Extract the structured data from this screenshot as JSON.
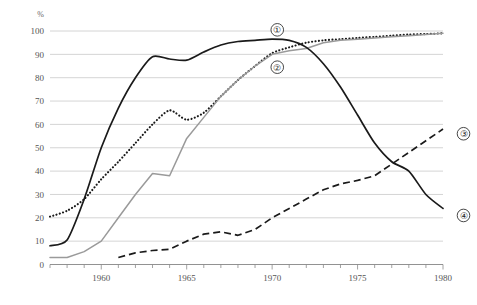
{
  "chart_data": {
    "type": "line",
    "title": "",
    "xlabel": "",
    "ylabel": "%",
    "yunit": "%",
    "xlim": [
      1957,
      1980
    ],
    "ylim": [
      0,
      100
    ],
    "grid": true,
    "legend_position": "inline-right",
    "yticks": [
      "0",
      "10",
      "20",
      "30",
      "40",
      "50",
      "60",
      "70",
      "80",
      "90",
      "100"
    ],
    "xticks": [
      "1960",
      "1965",
      "1970",
      "1975",
      "1980"
    ],
    "xtick_values": [
      1960,
      1965,
      1970,
      1975,
      1980
    ],
    "x_minor_ticks_every": 1,
    "series": [
      {
        "name": "1",
        "label": "①",
        "style": "dotted",
        "color": "#1a1a1a",
        "x": [
          1957,
          1958,
          1959,
          1960,
          1961,
          1962,
          1963,
          1964,
          1965,
          1966,
          1967,
          1968,
          1969,
          1970,
          1971,
          1972,
          1973,
          1974,
          1975,
          1976,
          1977,
          1978,
          1979,
          1980
        ],
        "values": [
          20.5,
          23,
          28,
          36.5,
          44,
          52,
          60,
          66,
          62,
          65,
          72,
          79,
          85,
          90.5,
          93,
          95,
          96,
          96.5,
          97,
          97.5,
          98,
          98.5,
          98.7,
          99
        ]
      },
      {
        "name": "2",
        "label": "②",
        "style": "solid-gray",
        "color": "#9a9a9a",
        "x": [
          1957,
          1958,
          1959,
          1960,
          1961,
          1962,
          1963,
          1964,
          1965,
          1966,
          1967,
          1968,
          1969,
          1970,
          1971,
          1972,
          1973,
          1974,
          1975,
          1976,
          1977,
          1978,
          1979,
          1980
        ],
        "values": [
          3,
          3,
          5.5,
          10,
          20,
          30,
          39,
          38,
          54,
          63,
          72,
          79,
          85,
          90,
          91.5,
          92.5,
          95,
          96,
          96.5,
          97,
          97.5,
          98,
          98.5,
          99
        ]
      },
      {
        "name": "3",
        "label": "③",
        "style": "dashed",
        "color": "#1a1a1a",
        "x": [
          1961,
          1962,
          1963,
          1964,
          1965,
          1966,
          1967,
          1968,
          1969,
          1970,
          1971,
          1972,
          1973,
          1974,
          1975,
          1976,
          1977,
          1978,
          1979,
          1980
        ],
        "values": [
          3,
          5,
          6,
          6.5,
          10,
          13,
          14,
          12.5,
          15,
          20,
          24,
          28,
          32,
          34.5,
          36,
          38,
          43,
          48,
          53,
          58
        ]
      },
      {
        "name": "4",
        "label": "④",
        "style": "solid",
        "color": "#1a1a1a",
        "x": [
          1957,
          1958,
          1959,
          1960,
          1961,
          1962,
          1963,
          1964,
          1965,
          1966,
          1967,
          1968,
          1969,
          1970,
          1971,
          1972,
          1973,
          1974,
          1975,
          1976,
          1977,
          1978,
          1979,
          1980
        ],
        "values": [
          8,
          10.5,
          28,
          50,
          67,
          80,
          89,
          88,
          87.5,
          91,
          94,
          95.5,
          96,
          96.5,
          96,
          93,
          86,
          76,
          64,
          52,
          44,
          40,
          30,
          24
        ]
      }
    ],
    "annotations": [
      {
        "label": "①",
        "x": 1970.3,
        "y": 100.5
      },
      {
        "label": "②",
        "x": 1970.3,
        "y": 84.5
      },
      {
        "label": "③",
        "x": 1981.2,
        "y": 56.0
      },
      {
        "label": "④",
        "x": 1981.2,
        "y": 21.0
      }
    ]
  }
}
